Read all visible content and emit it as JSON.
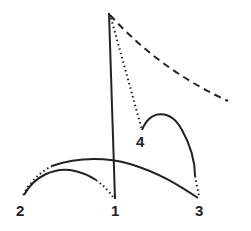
{
  "diagram": {
    "labels": [
      {
        "id": "p1",
        "text": "1",
        "x": 115,
        "y": 216
      },
      {
        "id": "p2",
        "text": "2",
        "x": 20,
        "y": 216
      },
      {
        "id": "p3",
        "text": "3",
        "x": 200,
        "y": 216
      },
      {
        "id": "p4",
        "text": "4",
        "x": 140,
        "y": 147
      }
    ],
    "colors": {
      "stroke": "#222222",
      "background": "#ffffff"
    }
  }
}
